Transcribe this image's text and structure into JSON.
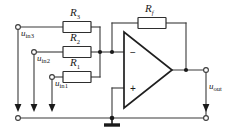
{
  "figure": {
    "name": "inverting-summing-amplifier",
    "background_color": "#ffffff",
    "wire_color": "#3a3a3a",
    "ink_color": "#1a1a1a"
  },
  "resistors": [
    {
      "id": "R3",
      "label_base": "R",
      "label_sub": "3",
      "name": "resistor-r3"
    },
    {
      "id": "R2",
      "label_base": "R",
      "label_sub": "2",
      "name": "resistor-r2"
    },
    {
      "id": "R1",
      "label_base": "R",
      "label_sub": "1",
      "name": "resistor-r1"
    },
    {
      "id": "Rf",
      "label_base": "R",
      "label_sub": "f",
      "name": "resistor-rf"
    }
  ],
  "sources": [
    {
      "id": "uin3",
      "label_base": "u",
      "label_sub": "in3",
      "name": "input-uin3"
    },
    {
      "id": "uin2",
      "label_base": "u",
      "label_sub": "in2",
      "name": "input-uin2"
    },
    {
      "id": "uin1",
      "label_base": "u",
      "label_sub": "in1",
      "name": "input-uin1"
    }
  ],
  "output": {
    "id": "uout",
    "label_base": "u",
    "label_sub": "out",
    "name": "output-uout"
  },
  "opamp": {
    "name": "operational-amplifier",
    "inverting_sign": "−",
    "noninverting_sign": "+"
  },
  "ground": {
    "name": "ground-symbol",
    "label": ""
  }
}
